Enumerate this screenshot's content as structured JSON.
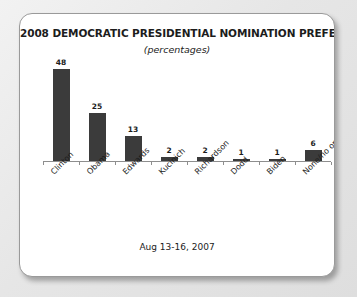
{
  "card": {
    "title": "2008 DEMOCRATIC PRESIDENTIAL NOMINATION PREFERENCE",
    "subtitle": "(percentages)",
    "footer": "Aug 13-16, 2007"
  },
  "colors": {
    "bar": "#3b3b3b",
    "axis": "#8e8e8e",
    "text": "#1c1c1c",
    "card_background": "#ffffff",
    "page_background": "#e6e6e6",
    "card_border": "#9a9a9a"
  },
  "chart_data": {
    "type": "bar",
    "title": "2008 DEMOCRATIC PRESIDENTIAL NOMINATION PREFERENCE",
    "subtitle": "(percentages)",
    "xlabel": "",
    "ylabel": "",
    "ylim": [
      0,
      50
    ],
    "grid": false,
    "legend": false,
    "annotation": "Aug 13-16, 2007",
    "categories": [
      "Clinton",
      "Obama",
      "Edwards",
      "Kucinich",
      "Richardson",
      "Dodd",
      "Biden",
      "None/no opinion"
    ],
    "values": [
      48,
      25,
      13,
      2,
      2,
      1,
      1,
      6
    ],
    "value_labels": [
      "48",
      "25",
      "13",
      "2",
      "2",
      "1",
      "1",
      "6"
    ]
  }
}
